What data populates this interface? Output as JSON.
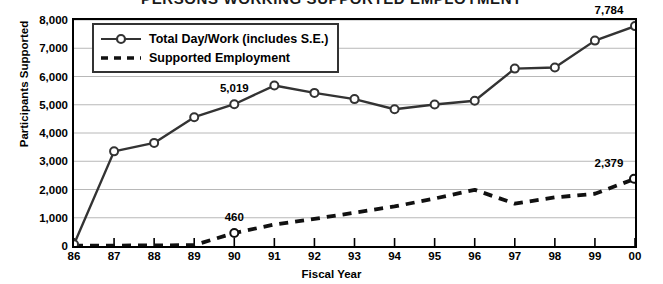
{
  "chart_data": {
    "type": "line",
    "title": "PERSONS WORKING SUPPORTED EMPLOYMENT",
    "xlabel": "Fiscal Year",
    "ylabel": "Participants Supported",
    "categories": [
      "86",
      "87",
      "88",
      "89",
      "90",
      "91",
      "92",
      "93",
      "94",
      "95",
      "96",
      "97",
      "98",
      "99",
      "00"
    ],
    "ylim": [
      0,
      8000
    ],
    "ytick_labels": [
      "0",
      "1,000",
      "2,000",
      "3,000",
      "4,000",
      "5,000",
      "6,000",
      "7,000",
      "8,000"
    ],
    "ytick_values": [
      0,
      1000,
      2000,
      3000,
      4000,
      5000,
      6000,
      7000,
      8000
    ],
    "grid": true,
    "legend_position": "top-left",
    "series": [
      {
        "name": "Total Day/Work (includes S.E.)",
        "style": "solid",
        "marker": "open-circle",
        "color": "#333333",
        "values": [
          60,
          3350,
          3650,
          4560,
          5019,
          5680,
          5420,
          5200,
          4840,
          5010,
          5140,
          6280,
          6320,
          7270,
          7784
        ]
      },
      {
        "name": "Supported Employment",
        "style": "dashed",
        "marker": "none",
        "color": "#111111",
        "values": [
          10,
          15,
          20,
          30,
          460,
          760,
          960,
          1180,
          1400,
          1680,
          1990,
          1500,
          1720,
          1850,
          2379
        ]
      }
    ],
    "annotations": [
      {
        "text": "5,019",
        "series": 0,
        "category": "90"
      },
      {
        "text": "7,784",
        "series": 0,
        "category": "00"
      },
      {
        "text": "460",
        "series": 1,
        "category": "90"
      },
      {
        "text": "2,379",
        "series": 1,
        "category": "00"
      }
    ]
  },
  "colors": {
    "plot_border": "#000000",
    "gridline": "#b8b8b8",
    "series_total": "#333333",
    "series_supported": "#111111",
    "legend_border": "#333333",
    "background": "#ffffff"
  }
}
